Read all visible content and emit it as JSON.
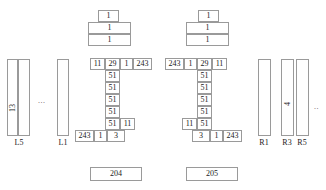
{
  "diagram": {
    "title": "",
    "left_group": {
      "bars": [
        {
          "label": "L5",
          "value": "13",
          "rotated": true
        },
        {
          "label": "L5b",
          "value": "",
          "rotated": false
        },
        {
          "label": "L1",
          "value": "",
          "rotated": false
        }
      ],
      "labels": [
        "L5",
        "L1"
      ],
      "ellipsis": "..."
    },
    "right_group": {
      "bars": [
        {
          "label": "R1",
          "value": ""
        },
        {
          "label": "R3",
          "value": "4",
          "rotated": true
        },
        {
          "label": "R5",
          "value": ""
        }
      ],
      "labels": [
        "R1",
        "R3",
        "R5"
      ],
      "ellipsis": ".."
    },
    "tree_left": {
      "id": "204",
      "footer_label": "204",
      "top_stack": [
        "1",
        "1",
        "1"
      ],
      "header_row": [
        "11",
        "29",
        "1",
        "243"
      ],
      "spine": [
        "51",
        "51",
        "51",
        "51",
        "51"
      ],
      "spine_side": "11",
      "bottom_row": [
        "243",
        "1",
        "3"
      ]
    },
    "tree_right": {
      "id": "205",
      "footer_label": "205",
      "top_stack": [
        "1",
        "1",
        "1"
      ],
      "header_row": [
        "243",
        "1",
        "29",
        "11"
      ],
      "spine": [
        "51",
        "51",
        "51",
        "51",
        "51"
      ],
      "spine_side": "11",
      "bottom_row": [
        "3",
        "1",
        "243"
      ]
    },
    "colors": {
      "stroke": "#9a9a9a",
      "text": "#222222",
      "background": "#ffffff"
    }
  }
}
